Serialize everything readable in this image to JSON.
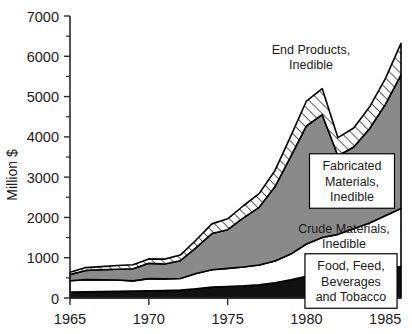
{
  "chart_data": {
    "type": "area",
    "title": "",
    "xlabel": "",
    "ylabel": "Million $",
    "xlim": [
      1965,
      1986
    ],
    "ylim": [
      0,
      7000
    ],
    "y_ticks": [
      0,
      1000,
      2000,
      3000,
      4000,
      5000,
      6000,
      7000
    ],
    "y_tick_labels": [
      "0",
      "1000",
      "2000",
      "3000",
      "4000",
      "5000",
      "6000",
      "7000"
    ],
    "y_minor_ticks": [
      500,
      1500,
      2500,
      3500,
      4500,
      5500,
      6500
    ],
    "x_ticks": [
      1965,
      1970,
      1975,
      1980,
      1985
    ],
    "x_tick_labels": [
      "1965",
      "1970",
      "1975",
      "1980",
      "1985"
    ],
    "grid": false,
    "stacked": true,
    "legend_position": "inline-annotations",
    "x": [
      1965,
      1966,
      1967,
      1968,
      1969,
      1970,
      1971,
      1972,
      1973,
      1974,
      1975,
      1976,
      1977,
      1978,
      1979,
      1980,
      1981,
      1982,
      1983,
      1984,
      1985,
      1986
    ],
    "series": [
      {
        "name": "Food, Feed, Beverages and Tobacco",
        "fill": "#111111",
        "pattern": "solid-black",
        "values": [
          150,
          155,
          160,
          165,
          170,
          180,
          185,
          195,
          230,
          270,
          285,
          300,
          330,
          380,
          450,
          540,
          600,
          620,
          660,
          700,
          740,
          780
        ]
      },
      {
        "name": "Crude Materials, Inedible",
        "fill": "#ffffff",
        "pattern": "solid-white",
        "values": [
          280,
          300,
          290,
          280,
          255,
          300,
          290,
          290,
          380,
          430,
          450,
          470,
          490,
          540,
          640,
          800,
          900,
          960,
          1060,
          1160,
          1300,
          1440
        ]
      },
      {
        "name": "Fabricated Materials, Inedible",
        "fill": "#8a8a8a",
        "pattern": "solid-gray",
        "values": [
          150,
          230,
          250,
          270,
          300,
          380,
          370,
          440,
          640,
          900,
          960,
          1220,
          1430,
          1840,
          2420,
          2930,
          3050,
          1950,
          2030,
          2340,
          2760,
          3320
        ]
      },
      {
        "name": "End Products, Inedible",
        "fill": "#ffffff",
        "pattern": "diagonal-hatch",
        "values": [
          60,
          70,
          80,
          90,
          100,
          110,
          120,
          140,
          190,
          240,
          270,
          300,
          340,
          400,
          500,
          620,
          650,
          450,
          470,
          540,
          640,
          780
        ]
      }
    ],
    "annotations": [
      {
        "name": "end-products-label",
        "text_lines": [
          "End Products,",
          "Inedible"
        ],
        "boxed": false,
        "x": 311,
        "y": 57
      },
      {
        "name": "fabricated-materials-label",
        "text_lines": [
          "Fabricated",
          "Materials,",
          "Inedible"
        ],
        "boxed": true,
        "x": 352,
        "y": 181
      },
      {
        "name": "crude-materials-label",
        "text_lines": [
          "Crude Materials,",
          "Inedible"
        ],
        "boxed": false,
        "x": 344,
        "y": 236
      },
      {
        "name": "food-feed-label",
        "text_lines": [
          "Food, Feed,",
          "Beverages",
          "and Tobacco"
        ],
        "boxed": true,
        "x": 351,
        "y": 281
      }
    ]
  },
  "axes": {
    "y_axis_label": "Million $"
  }
}
